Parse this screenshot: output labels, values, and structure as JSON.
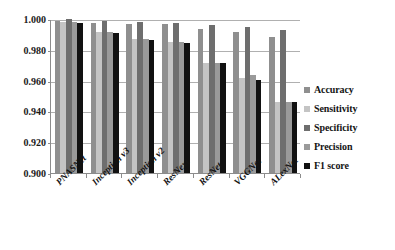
{
  "chart_data": {
    "type": "bar",
    "title": "",
    "subtitle": "",
    "xlabel": "",
    "ylabel": "",
    "ylim": [
      0.9,
      1.0
    ],
    "yticks": [
      "0.900",
      "0.920",
      "0.940",
      "0.960",
      "0.980",
      "1.000"
    ],
    "ytick_values": [
      0.9,
      0.92,
      0.94,
      0.96,
      0.98,
      1.0
    ],
    "grid": true,
    "legend_position": "right",
    "categories": [
      "PNASNet",
      "Inception v3",
      "Inception v2",
      "ResNext",
      "ResNet",
      "VGGNet",
      "ALexNet"
    ],
    "series": [
      {
        "name": "Accuracy",
        "color": "#8f8f8f",
        "values": [
          0.999,
          0.9977,
          0.9969,
          0.9965,
          0.9933,
          0.9918,
          0.9884
        ]
      },
      {
        "name": "Sensitivity",
        "color": "#c4c4c4",
        "values": [
          0.9982,
          0.9913,
          0.987,
          0.9849,
          0.9715,
          0.9615,
          0.9463
        ]
      },
      {
        "name": "Specificity",
        "color": "#6e6e6e",
        "values": [
          0.9998,
          0.9988,
          0.9982,
          0.9976,
          0.9962,
          0.9946,
          0.9931
        ]
      },
      {
        "name": "Precision",
        "color": "#9a9a9a",
        "values": [
          0.9982,
          0.9913,
          0.987,
          0.9849,
          0.9717,
          0.9637,
          0.9461
        ]
      },
      {
        "name": "F1 score",
        "color": "#111111",
        "values": [
          0.9975,
          0.991,
          0.9866,
          0.9843,
          0.9716,
          0.9607,
          0.9462
        ]
      }
    ]
  },
  "legend": {
    "items": [
      {
        "label": "Accuracy"
      },
      {
        "label": "Sensitivity"
      },
      {
        "label": "Specificity"
      },
      {
        "label": "Precision"
      },
      {
        "label": "F1 score"
      }
    ]
  }
}
